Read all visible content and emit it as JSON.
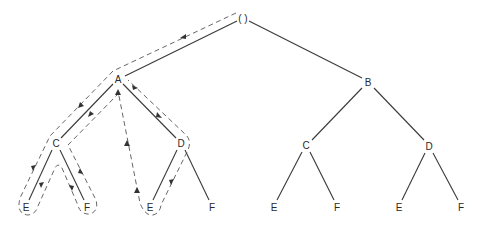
{
  "diagram": {
    "type": "tree-traversal",
    "nodes": [
      {
        "id": "root",
        "label": "( )",
        "x": 243,
        "y": 18
      },
      {
        "id": "A",
        "label": "A",
        "x": 118,
        "y": 78
      },
      {
        "id": "B",
        "label": "B",
        "x": 368,
        "y": 82
      },
      {
        "id": "AC",
        "label": "C",
        "x": 56,
        "y": 143
      },
      {
        "id": "AD",
        "label": "D",
        "x": 181,
        "y": 143
      },
      {
        "id": "BC",
        "label": "C",
        "x": 306,
        "y": 145
      },
      {
        "id": "BD",
        "label": "D",
        "x": 429,
        "y": 146
      },
      {
        "id": "ACE",
        "label": "E",
        "x": 26,
        "y": 207
      },
      {
        "id": "ACF",
        "label": "F",
        "x": 87,
        "y": 207
      },
      {
        "id": "ADE",
        "label": "E",
        "x": 150,
        "y": 207
      },
      {
        "id": "ADF",
        "label": "F",
        "x": 212,
        "y": 207
      },
      {
        "id": "BCE",
        "label": "E",
        "x": 274,
        "y": 207
      },
      {
        "id": "BCF",
        "label": "F",
        "x": 337,
        "y": 207
      },
      {
        "id": "BDE",
        "label": "E",
        "x": 399,
        "y": 207
      },
      {
        "id": "BDF",
        "label": "F",
        "x": 461,
        "y": 207
      }
    ],
    "edges": [
      [
        "root",
        "A"
      ],
      [
        "root",
        "B"
      ],
      [
        "A",
        "AC"
      ],
      [
        "A",
        "AD"
      ],
      [
        "B",
        "BC"
      ],
      [
        "B",
        "BD"
      ],
      [
        "AC",
        "ACE"
      ],
      [
        "AC",
        "ACF"
      ],
      [
        "AD",
        "ADE"
      ],
      [
        "AD",
        "ADF"
      ],
      [
        "BC",
        "BCE"
      ],
      [
        "BC",
        "BCF"
      ],
      [
        "BD",
        "BDE"
      ],
      [
        "BD",
        "BDF"
      ]
    ],
    "traversal_path_description": "Dashed outline traces a depth-first walk from root down to A, around C's subtree (E, F), back up to A, down through D to E, and back to A with arrows",
    "labels": {
      "root": "( )",
      "A": "A",
      "B": "B",
      "C": "C",
      "D": "D",
      "E": "E",
      "F": "F"
    }
  }
}
